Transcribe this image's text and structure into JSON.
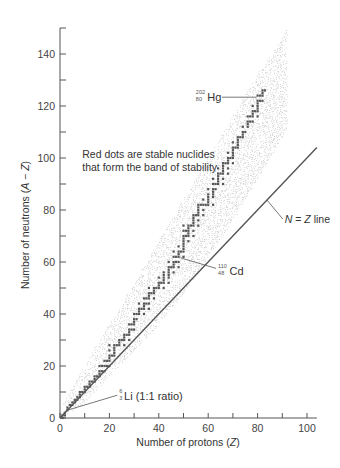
{
  "chart_data": {
    "type": "scatter",
    "title": "",
    "xlabel": "Number of protons (Z)",
    "ylabel": "Number of neutrons (A − Z)",
    "xlim": [
      0,
      104
    ],
    "ylim": [
      0,
      150
    ],
    "xticks": [
      0,
      20,
      40,
      60,
      80,
      100
    ],
    "xminor": [
      10,
      30,
      50,
      70,
      90
    ],
    "yticks": [
      0,
      20,
      40,
      60,
      80,
      100,
      120,
      140
    ],
    "yminor": [
      10,
      30,
      50,
      70,
      90,
      110,
      130,
      150
    ],
    "grid": false,
    "legend": null,
    "series": [
      {
        "name": "Stable nuclides (band of stability)",
        "color": "#555555",
        "points": [
          [
            1,
            0
          ],
          [
            1,
            1
          ],
          [
            2,
            1
          ],
          [
            2,
            2
          ],
          [
            3,
            3
          ],
          [
            3,
            4
          ],
          [
            4,
            5
          ],
          [
            5,
            5
          ],
          [
            5,
            6
          ],
          [
            6,
            6
          ],
          [
            6,
            7
          ],
          [
            7,
            7
          ],
          [
            7,
            8
          ],
          [
            8,
            8
          ],
          [
            8,
            9
          ],
          [
            8,
            10
          ],
          [
            9,
            10
          ],
          [
            10,
            10
          ],
          [
            10,
            11
          ],
          [
            10,
            12
          ],
          [
            11,
            12
          ],
          [
            12,
            12
          ],
          [
            12,
            13
          ],
          [
            12,
            14
          ],
          [
            13,
            14
          ],
          [
            14,
            14
          ],
          [
            14,
            15
          ],
          [
            14,
            16
          ],
          [
            15,
            16
          ],
          [
            16,
            16
          ],
          [
            16,
            17
          ],
          [
            16,
            18
          ],
          [
            16,
            20
          ],
          [
            17,
            18
          ],
          [
            17,
            20
          ],
          [
            18,
            18
          ],
          [
            18,
            20
          ],
          [
            18,
            22
          ],
          [
            19,
            20
          ],
          [
            19,
            22
          ],
          [
            20,
            20
          ],
          [
            20,
            22
          ],
          [
            20,
            23
          ],
          [
            20,
            24
          ],
          [
            20,
            26
          ],
          [
            20,
            28
          ],
          [
            21,
            24
          ],
          [
            22,
            24
          ],
          [
            22,
            25
          ],
          [
            22,
            26
          ],
          [
            22,
            27
          ],
          [
            22,
            28
          ],
          [
            23,
            28
          ],
          [
            24,
            28
          ],
          [
            24,
            29
          ],
          [
            24,
            30
          ],
          [
            25,
            30
          ],
          [
            26,
            28
          ],
          [
            26,
            30
          ],
          [
            26,
            31
          ],
          [
            26,
            32
          ],
          [
            27,
            32
          ],
          [
            28,
            30
          ],
          [
            28,
            32
          ],
          [
            28,
            33
          ],
          [
            28,
            34
          ],
          [
            28,
            36
          ],
          [
            29,
            34
          ],
          [
            29,
            36
          ],
          [
            30,
            34
          ],
          [
            30,
            36
          ],
          [
            30,
            37
          ],
          [
            30,
            38
          ],
          [
            30,
            40
          ],
          [
            31,
            38
          ],
          [
            31,
            40
          ],
          [
            32,
            40
          ],
          [
            32,
            41
          ],
          [
            32,
            42
          ],
          [
            32,
            44
          ],
          [
            33,
            42
          ],
          [
            34,
            40
          ],
          [
            34,
            42
          ],
          [
            34,
            43
          ],
          [
            34,
            44
          ],
          [
            34,
            46
          ],
          [
            35,
            44
          ],
          [
            35,
            46
          ],
          [
            36,
            42
          ],
          [
            36,
            44
          ],
          [
            36,
            46
          ],
          [
            36,
            47
          ],
          [
            36,
            48
          ],
          [
            36,
            50
          ],
          [
            37,
            48
          ],
          [
            38,
            46
          ],
          [
            38,
            48
          ],
          [
            38,
            49
          ],
          [
            38,
            50
          ],
          [
            39,
            50
          ],
          [
            40,
            50
          ],
          [
            40,
            51
          ],
          [
            40,
            52
          ],
          [
            40,
            54
          ],
          [
            41,
            52
          ],
          [
            42,
            50
          ],
          [
            42,
            52
          ],
          [
            42,
            53
          ],
          [
            42,
            54
          ],
          [
            42,
            55
          ],
          [
            42,
            56
          ],
          [
            44,
            52
          ],
          [
            44,
            54
          ],
          [
            44,
            55
          ],
          [
            44,
            56
          ],
          [
            44,
            57
          ],
          [
            44,
            58
          ],
          [
            44,
            60
          ],
          [
            45,
            58
          ],
          [
            46,
            56
          ],
          [
            46,
            58
          ],
          [
            46,
            59
          ],
          [
            46,
            60
          ],
          [
            46,
            62
          ],
          [
            46,
            64
          ],
          [
            47,
            60
          ],
          [
            47,
            62
          ],
          [
            48,
            58
          ],
          [
            48,
            60
          ],
          [
            48,
            62
          ],
          [
            48,
            63
          ],
          [
            48,
            64
          ],
          [
            48,
            66
          ],
          [
            49,
            64
          ],
          [
            50,
            62
          ],
          [
            50,
            64
          ],
          [
            50,
            65
          ],
          [
            50,
            66
          ],
          [
            50,
            67
          ],
          [
            50,
            68
          ],
          [
            50,
            69
          ],
          [
            50,
            70
          ],
          [
            50,
            72
          ],
          [
            50,
            74
          ],
          [
            51,
            70
          ],
          [
            51,
            72
          ],
          [
            52,
            68
          ],
          [
            52,
            70
          ],
          [
            52,
            71
          ],
          [
            52,
            72
          ],
          [
            52,
            73
          ],
          [
            52,
            74
          ],
          [
            53,
            74
          ],
          [
            54,
            70
          ],
          [
            54,
            72
          ],
          [
            54,
            74
          ],
          [
            54,
            75
          ],
          [
            54,
            76
          ],
          [
            54,
            77
          ],
          [
            54,
            78
          ],
          [
            55,
            78
          ],
          [
            56,
            74
          ],
          [
            56,
            76
          ],
          [
            56,
            78
          ],
          [
            56,
            79
          ],
          [
            56,
            80
          ],
          [
            56,
            81
          ],
          [
            56,
            82
          ],
          [
            57,
            82
          ],
          [
            58,
            78
          ],
          [
            58,
            80
          ],
          [
            58,
            82
          ],
          [
            58,
            84
          ],
          [
            59,
            82
          ],
          [
            60,
            82
          ],
          [
            60,
            83
          ],
          [
            60,
            84
          ],
          [
            60,
            85
          ],
          [
            60,
            86
          ],
          [
            60,
            88
          ],
          [
            62,
            82
          ],
          [
            62,
            85
          ],
          [
            62,
            86
          ],
          [
            62,
            87
          ],
          [
            62,
            88
          ],
          [
            62,
            90
          ],
          [
            62,
            92
          ],
          [
            63,
            88
          ],
          [
            63,
            90
          ],
          [
            64,
            90
          ],
          [
            64,
            91
          ],
          [
            64,
            92
          ],
          [
            64,
            93
          ],
          [
            64,
            94
          ],
          [
            64,
            96
          ],
          [
            65,
            94
          ],
          [
            66,
            90
          ],
          [
            66,
            92
          ],
          [
            66,
            94
          ],
          [
            66,
            95
          ],
          [
            66,
            96
          ],
          [
            66,
            97
          ],
          [
            66,
            98
          ],
          [
            67,
            98
          ],
          [
            68,
            94
          ],
          [
            68,
            96
          ],
          [
            68,
            98
          ],
          [
            68,
            99
          ],
          [
            68,
            100
          ],
          [
            68,
            102
          ],
          [
            69,
            100
          ],
          [
            70,
            98
          ],
          [
            70,
            100
          ],
          [
            70,
            101
          ],
          [
            70,
            102
          ],
          [
            70,
            103
          ],
          [
            70,
            104
          ],
          [
            70,
            106
          ],
          [
            71,
            104
          ],
          [
            72,
            104
          ],
          [
            72,
            105
          ],
          [
            72,
            106
          ],
          [
            72,
            107
          ],
          [
            72,
            108
          ],
          [
            73,
            108
          ],
          [
            74,
            108
          ],
          [
            74,
            109
          ],
          [
            74,
            110
          ],
          [
            74,
            112
          ],
          [
            75,
            110
          ],
          [
            76,
            112
          ],
          [
            76,
            113
          ],
          [
            76,
            114
          ],
          [
            76,
            116
          ],
          [
            77,
            114
          ],
          [
            77,
            116
          ],
          [
            78,
            114
          ],
          [
            78,
            116
          ],
          [
            78,
            117
          ],
          [
            78,
            118
          ],
          [
            78,
            120
          ],
          [
            79,
            118
          ],
          [
            80,
            116
          ],
          [
            80,
            118
          ],
          [
            80,
            119
          ],
          [
            80,
            120
          ],
          [
            80,
            121
          ],
          [
            80,
            122
          ],
          [
            80,
            124
          ],
          [
            81,
            122
          ],
          [
            81,
            124
          ],
          [
            82,
            122
          ],
          [
            82,
            124
          ],
          [
            82,
            125
          ],
          [
            82,
            126
          ],
          [
            83,
            126
          ]
        ]
      },
      {
        "name": "Unstable nuclides (stippled region)",
        "color": "#aaaaaa",
        "envelope_upper": [
          [
            0,
            3
          ],
          [
            5,
            12
          ],
          [
            10,
            20
          ],
          [
            20,
            36
          ],
          [
            30,
            52
          ],
          [
            40,
            68
          ],
          [
            50,
            84
          ],
          [
            60,
            100
          ],
          [
            70,
            116
          ],
          [
            80,
            132
          ],
          [
            90,
            146
          ],
          [
            92,
            150
          ]
        ],
        "envelope_lower": [
          [
            0,
            0
          ],
          [
            10,
            6
          ],
          [
            20,
            16
          ],
          [
            30,
            26
          ],
          [
            40,
            36
          ],
          [
            50,
            48
          ],
          [
            60,
            62
          ],
          [
            70,
            76
          ],
          [
            80,
            92
          ],
          [
            90,
            108
          ],
          [
            95,
            118
          ],
          [
            104,
            140
          ]
        ]
      },
      {
        "name": "N = Z line",
        "color": "#555555",
        "points": [
          [
            0,
            0
          ],
          [
            104,
            104
          ]
        ]
      }
    ],
    "annotations": [
      {
        "id": "hg",
        "element": "Hg",
        "mass": "202",
        "atomic": "80",
        "at": [
          80,
          122
        ],
        "label_pos": [
          55,
          123
        ]
      },
      {
        "id": "cd",
        "element": "Cd",
        "mass": "110",
        "atomic": "48",
        "at": [
          48,
          62
        ],
        "label_pos": [
          64,
          56
        ]
      },
      {
        "id": "li",
        "element": "Li",
        "mass": "6",
        "atomic": "3",
        "suffix": " (1:1 ratio)",
        "at": [
          3,
          3
        ],
        "label_pos": [
          24,
          8
        ]
      },
      {
        "id": "nz",
        "text_n": "N",
        "text_eq": " = ",
        "text_z": "Z",
        "text_rest": " line",
        "at": [
          85,
          85
        ],
        "label_pos": [
          91,
          75
        ]
      },
      {
        "id": "note",
        "lines": [
          "Red dots are stable nuclides",
          "that form the band of stability"
        ],
        "label_pos": [
          9,
          100
        ]
      }
    ]
  }
}
